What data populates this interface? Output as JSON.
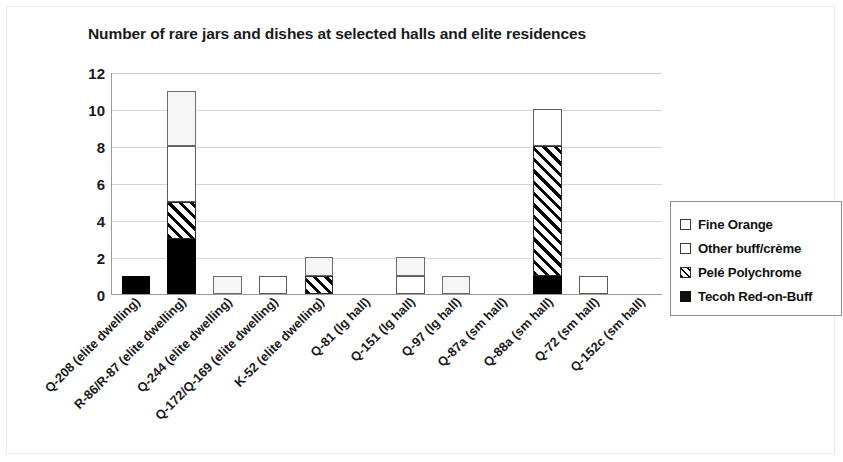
{
  "chart_data": {
    "type": "bar",
    "subtype": "stacked-bar",
    "title": "Number of rare jars and dishes at selected halls and elite residences",
    "xlabel": "",
    "ylabel": "",
    "ylim": [
      0,
      12
    ],
    "yticks": [
      12,
      10,
      8,
      6,
      4,
      2,
      0
    ],
    "grid": true,
    "legend_position": "right",
    "categories": [
      "Q-208 (elite dwelling)",
      "R-86/R-87 (elite dwelling)",
      "Q-244 (elite dwelling)",
      "Q-172/Q-169 (elite dwelling)",
      "K-52 (elite dwelling)",
      "Q-81 (lg hall)",
      "Q-151 (lg hall)",
      "Q-97 (lg hall)",
      "Q-87a (sm hall)",
      "Q-88a (sm hall)",
      "Q-72 (sm hall)",
      "Q-152c (sm hall)"
    ],
    "series": [
      {
        "name": "Tecoh Red-on-Buff",
        "color": "#000000",
        "pattern": "solid-black",
        "values": [
          1,
          3,
          0,
          0,
          0,
          0,
          0,
          0,
          0,
          1,
          0,
          0
        ]
      },
      {
        "name": "Pelé Polychrome",
        "color": "#000000",
        "pattern": "diagonal-hatch",
        "values": [
          0,
          2,
          0,
          0,
          1,
          0,
          0,
          0,
          0,
          7,
          0,
          0
        ]
      },
      {
        "name": "Other buff/crème",
        "color": "#ffffff",
        "pattern": "white",
        "values": [
          0,
          3,
          0,
          1,
          0,
          0,
          1,
          0,
          0,
          2,
          1,
          0
        ]
      },
      {
        "name": "Fine Orange",
        "color": "#f6f6f6",
        "pattern": "light-grey",
        "values": [
          0,
          3,
          1,
          0,
          1,
          0,
          1,
          1,
          0,
          0,
          0,
          0
        ]
      }
    ],
    "totals": [
      1,
      11,
      1,
      1,
      2,
      0,
      2,
      1,
      0,
      10,
      1,
      0
    ]
  },
  "legend": {
    "items": [
      {
        "label": "Fine Orange",
        "swatch": "fine-orange-swatch"
      },
      {
        "label": "Other buff/crème",
        "swatch": "other-buff-swatch"
      },
      {
        "label": "Pelé Polychrome",
        "swatch": "pele-polychrome-swatch"
      },
      {
        "label": "Tecoh Red-on-Buff",
        "swatch": "tecoh-red-swatch"
      }
    ]
  }
}
